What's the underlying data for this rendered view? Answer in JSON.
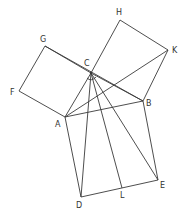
{
  "diagram": {
    "colors": {
      "line": "#3a3a3a",
      "label": "#333333",
      "background": "#ffffff"
    },
    "points": {
      "A": [
        65,
        117
      ],
      "B": [
        143,
        101
      ],
      "C": [
        91,
        73
      ],
      "D": [
        81,
        197
      ],
      "E": [
        158,
        180
      ],
      "F": [
        19,
        91
      ],
      "G": [
        45,
        46
      ],
      "H": [
        120,
        20
      ],
      "K": [
        168,
        50
      ],
      "L": [
        122,
        188
      ]
    },
    "labels": [
      {
        "text": "H",
        "x": 116,
        "y": 15
      },
      {
        "text": "G",
        "x": 40,
        "y": 42
      },
      {
        "text": "C",
        "x": 84,
        "y": 66
      },
      {
        "text": "K",
        "x": 172,
        "y": 53
      },
      {
        "text": "F",
        "x": 10,
        "y": 95
      },
      {
        "text": "B",
        "x": 146,
        "y": 106
      },
      {
        "text": "A",
        "x": 55,
        "y": 127
      },
      {
        "text": "E",
        "x": 160,
        "y": 188
      },
      {
        "text": "L",
        "x": 120,
        "y": 198
      },
      {
        "text": "D",
        "x": 76,
        "y": 208
      }
    ],
    "segments": [
      [
        "A",
        "B"
      ],
      [
        "B",
        "C"
      ],
      [
        "C",
        "A"
      ],
      [
        "A",
        "F"
      ],
      [
        "F",
        "G"
      ],
      [
        "G",
        "C"
      ],
      [
        "C",
        "H"
      ],
      [
        "H",
        "K"
      ],
      [
        "K",
        "B"
      ],
      [
        "A",
        "D"
      ],
      [
        "D",
        "E"
      ],
      [
        "E",
        "B"
      ],
      [
        "C",
        "L"
      ],
      [
        "C",
        "D"
      ],
      [
        "C",
        "E"
      ],
      [
        "A",
        "K"
      ],
      [
        "G",
        "B"
      ]
    ]
  }
}
